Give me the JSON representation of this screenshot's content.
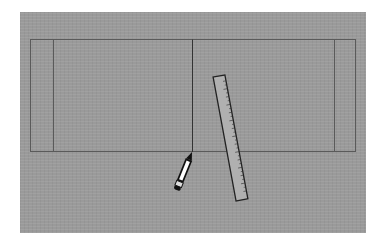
{
  "scene": {
    "background_color": "#ffffff",
    "canvas_color": "#9a9a9a",
    "line_color": "#555555"
  },
  "drawing": {
    "outer_rect": {
      "x1": 30,
      "y1": 39,
      "x2": 355,
      "y2": 151
    },
    "inner_left_line_x": 53,
    "inner_right_line_x": 334,
    "center_line_x": 192
  },
  "tools": {
    "pencil": {
      "label": "pencil",
      "tip": [
        192,
        152
      ],
      "end": [
        176,
        191
      ]
    },
    "ruler": {
      "label": "ruler",
      "top": [
        219,
        76
      ],
      "bottom": [
        242,
        200
      ],
      "width": 12
    }
  }
}
